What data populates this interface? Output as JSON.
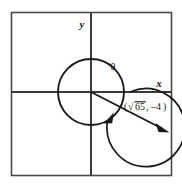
{
  "figure": {
    "background_color": "#ffffff",
    "ink_color": "#1a1a1a",
    "frame": {
      "stroke_color": "#4a4a4a",
      "left": 11,
      "top": 12,
      "right": 172,
      "bottom": 176
    },
    "axes": {
      "x_label": "x",
      "y_label": "y",
      "origin_x": 91,
      "origin_y": 92,
      "stroke_color": "#3a3a3a"
    },
    "circle": {
      "center_x": 91,
      "center_y": 92,
      "radius": 33,
      "stroke_color": "#1a1a1a"
    },
    "angle": {
      "label": "θ",
      "label_x": 113,
      "label_y": 70,
      "sweep_direction": "clockwise-from-positive-x-axis",
      "arc_stroke_color": "#1a1a1a"
    },
    "terminal_ray": {
      "from_x": 91,
      "from_y": 92,
      "to_x": 168,
      "to_y": 132,
      "stroke_color": "#1a1a1a"
    },
    "point_label": {
      "open_paren": "(",
      "radical_sign": "√",
      "radicand": "65",
      "separator": ",",
      "y_value": "–4",
      "close_paren": ")",
      "full_text": "(√65, –4)",
      "x": 124,
      "y": 110
    }
  }
}
